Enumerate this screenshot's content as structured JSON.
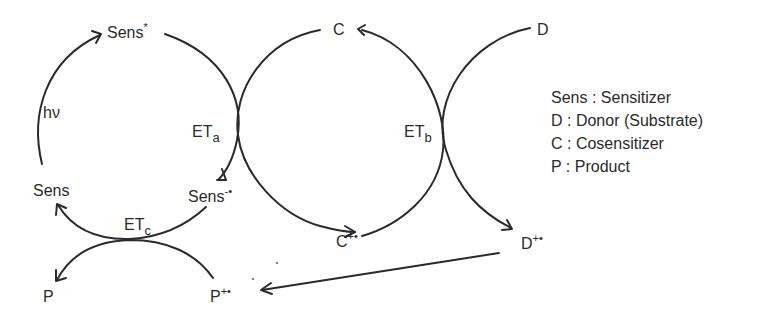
{
  "diagram": {
    "species": {
      "sens_star": {
        "base": "Sens",
        "sup": "*"
      },
      "sens": {
        "base": "Sens",
        "sup": ""
      },
      "sens_radical_anion": {
        "base": "Sens",
        "sup": "-•"
      },
      "cosensitizer": {
        "base": "C",
        "sup": ""
      },
      "cosensitizer_radical_cation": {
        "base": "C",
        "sup": "+•"
      },
      "donor": {
        "base": "D",
        "sup": ""
      },
      "donor_radical_cation": {
        "base": "D",
        "sup": "+•"
      },
      "product": {
        "base": "P",
        "sup": ""
      },
      "product_radical_cation": {
        "base": "P",
        "sup": "+•"
      }
    },
    "steps": {
      "excitation": "hν",
      "et_a": {
        "base": "ET",
        "sub": "a"
      },
      "et_b": {
        "base": "ET",
        "sub": "b"
      },
      "et_c": {
        "base": "ET",
        "sub": "c"
      }
    },
    "edges": [
      {
        "from": "Sens",
        "to": "Sens*",
        "label": "hν"
      },
      {
        "from": "Sens*",
        "to": "Sens-•",
        "label": "ETa"
      },
      {
        "from": "C+•",
        "to": "C",
        "label": "ETa"
      },
      {
        "from": "C",
        "to": "C+•",
        "label": "ETb"
      },
      {
        "from": "D",
        "to": "D+•",
        "label": "ETb"
      },
      {
        "from": "D+•",
        "to": "P+•",
        "label": ""
      },
      {
        "from": "Sens-•",
        "to": "Sens",
        "label": "ETc"
      },
      {
        "from": "P+•",
        "to": "P",
        "label": "ETc"
      }
    ]
  },
  "legend": {
    "items": [
      {
        "key": "Sens",
        "sep": " : ",
        "value": "Sensitizer"
      },
      {
        "key": "D",
        "sep": " : ",
        "value": "Donor (Substrate)"
      },
      {
        "key": "C",
        "sep": " : ",
        "value": "Cosensitizer"
      },
      {
        "key": "P",
        "sep": " : ",
        "value": "Product"
      }
    ]
  },
  "colors": {
    "ink": "#2a2a2a",
    "background": "#ffffff"
  }
}
